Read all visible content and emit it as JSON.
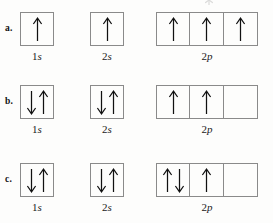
{
  "figure": {
    "type": "orbital-diagram",
    "caption_note": "",
    "rows": [
      {
        "label": "a.",
        "groups": [
          {
            "name": "1s",
            "number": "1",
            "letter": "s",
            "boxes": [
              {
                "electrons": [
                  "up"
                ]
              }
            ]
          },
          {
            "name": "2s",
            "number": "2",
            "letter": "s",
            "boxes": [
              {
                "electrons": [
                  "up"
                ]
              }
            ]
          },
          {
            "name": "2p",
            "number": "2",
            "letter": "p",
            "boxes": [
              {
                "electrons": [
                  "up"
                ]
              },
              {
                "electrons": [
                  "up"
                ]
              },
              {
                "electrons": [
                  "up"
                ]
              }
            ]
          }
        ]
      },
      {
        "label": "b.",
        "groups": [
          {
            "name": "1s",
            "number": "1",
            "letter": "s",
            "boxes": [
              {
                "electrons": [
                  "down",
                  "up"
                ]
              }
            ]
          },
          {
            "name": "2s",
            "number": "2",
            "letter": "s",
            "boxes": [
              {
                "electrons": [
                  "down",
                  "up"
                ]
              }
            ]
          },
          {
            "name": "2p",
            "number": "2",
            "letter": "p",
            "boxes": [
              {
                "electrons": [
                  "up"
                ]
              },
              {
                "electrons": [
                  "up"
                ]
              },
              {
                "electrons": []
              }
            ]
          }
        ]
      },
      {
        "label": "c.",
        "groups": [
          {
            "name": "1s",
            "number": "1",
            "letter": "s",
            "boxes": [
              {
                "electrons": [
                  "down",
                  "up"
                ]
              }
            ]
          },
          {
            "name": "2s",
            "number": "2",
            "letter": "s",
            "boxes": [
              {
                "electrons": [
                  "down",
                  "up"
                ]
              }
            ]
          },
          {
            "name": "2p",
            "number": "2",
            "letter": "p",
            "boxes": [
              {
                "electrons": [
                  "up",
                  "down"
                ]
              },
              {
                "electrons": [
                  "up"
                ]
              },
              {
                "electrons": []
              }
            ]
          }
        ]
      }
    ]
  },
  "colors": {
    "background": "#fdfdfc",
    "box_border": "#8a8a8a",
    "arrow": "#111111",
    "text": "#1a1a1a"
  },
  "layout": {
    "row_tops": [
      12,
      85,
      163
    ],
    "group_lefts": [
      20,
      90,
      156
    ],
    "box_size": 34
  }
}
